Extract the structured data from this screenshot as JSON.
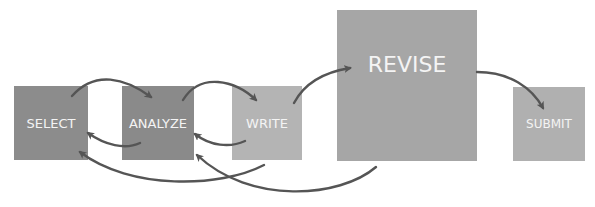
{
  "diagram": {
    "type": "process-flow",
    "steps": [
      {
        "id": "select",
        "label": "SELECT",
        "color": "#8c8c8c"
      },
      {
        "id": "analyze",
        "label": "ANALYZE",
        "color": "#8a8a8a"
      },
      {
        "id": "write",
        "label": "WRITE",
        "color": "#b4b4b4"
      },
      {
        "id": "revise",
        "label": "REVISE",
        "color": "#a6a6a6"
      },
      {
        "id": "submit",
        "label": "SUBMIT",
        "color": "#b0b0b0"
      }
    ],
    "arrow_color": "#555555",
    "edges": [
      {
        "from": "select",
        "to": "analyze"
      },
      {
        "from": "analyze",
        "to": "select"
      },
      {
        "from": "analyze",
        "to": "write"
      },
      {
        "from": "write",
        "to": "analyze"
      },
      {
        "from": "write",
        "to": "select"
      },
      {
        "from": "write",
        "to": "revise"
      },
      {
        "from": "revise",
        "to": "analyze"
      },
      {
        "from": "revise",
        "to": "submit"
      }
    ]
  }
}
